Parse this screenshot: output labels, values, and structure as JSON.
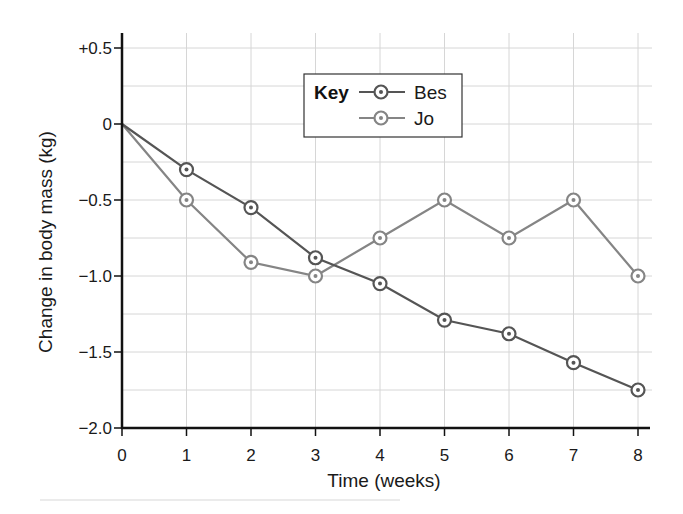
{
  "chart_data": {
    "type": "line",
    "title": "",
    "xlabel": "Time (weeks)",
    "ylabel": "Change in body mass (kg)",
    "x": [
      0,
      1,
      2,
      3,
      4,
      5,
      6,
      7,
      8
    ],
    "xticks": [
      "0",
      "1",
      "2",
      "3",
      "4",
      "5",
      "6",
      "7",
      "8"
    ],
    "yticks": [
      {
        "value": 0.5,
        "label": "+0.5"
      },
      {
        "value": 0,
        "label": "0"
      },
      {
        "value": -0.5,
        "label": "−0.5"
      },
      {
        "value": -1.0,
        "label": "−1.0"
      },
      {
        "value": -1.5,
        "label": "−1.5"
      },
      {
        "value": -2.0,
        "label": "−2.0"
      }
    ],
    "xlim": [
      0,
      8
    ],
    "ylim": [
      -2.0,
      0.5
    ],
    "grid": true,
    "minor_grid_step_y": 0.25,
    "legend": {
      "title": "Key",
      "position": "upper center"
    },
    "series": [
      {
        "name": "Bes",
        "color": "#555555",
        "marker": "circle-dot",
        "values": [
          0,
          -0.3,
          -0.55,
          -0.88,
          -1.05,
          -1.29,
          -1.38,
          -1.57,
          -1.75
        ]
      },
      {
        "name": "Jo",
        "color": "#858585",
        "marker": "circle-dot",
        "values": [
          0,
          -0.5,
          -0.91,
          -1.0,
          -0.75,
          -0.5,
          -0.75,
          -0.5,
          -1.0
        ]
      }
    ]
  }
}
